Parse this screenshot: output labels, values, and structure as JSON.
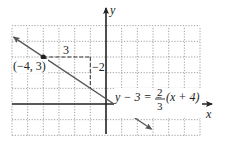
{
  "chart_data": {
    "type": "line",
    "title": "",
    "xlabel": "x",
    "ylabel": "y",
    "xlim": [
      -6,
      6
    ],
    "ylim": [
      -2,
      5
    ],
    "grid": true,
    "grid_style": "dotted",
    "series": [
      {
        "name": "y - 3 = -2/3(x + 4)",
        "slope": -0.6667,
        "point": [
          -4,
          3
        ],
        "x": [
          -5.9,
          -4,
          -1,
          0.5,
          2.9
        ],
        "values": [
          4.27,
          3,
          1,
          0,
          -1.6
        ]
      }
    ],
    "annotations": [
      {
        "text": "(-4, 3)",
        "x": -4,
        "y": 3,
        "type": "point-label"
      },
      {
        "text": "3",
        "type": "run",
        "from": [
          -4,
          3
        ],
        "to": [
          -1,
          3
        ]
      },
      {
        "text": "-2",
        "type": "rise",
        "from": [
          -1,
          3
        ],
        "to": [
          -1,
          1
        ]
      },
      {
        "text": "y - 3 = -2/3(x + 4)",
        "type": "equation-label"
      }
    ]
  },
  "labels": {
    "x_axis": "x",
    "y_axis": "y",
    "point": "(−4, 3)",
    "run": "3",
    "rise": "−2",
    "eq_left": "y − 3 = −",
    "eq_num": "2",
    "eq_den": "3",
    "eq_right": "(x + 4)"
  },
  "colors": {
    "axis": "#222222",
    "grid": "#888888",
    "line": "#555555",
    "point": "#222222"
  }
}
